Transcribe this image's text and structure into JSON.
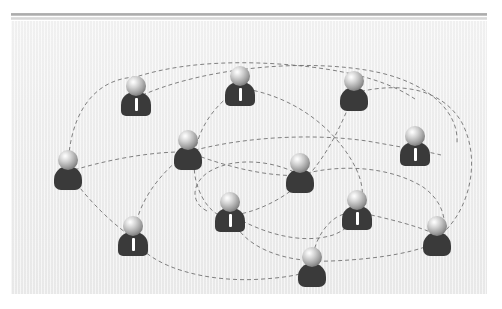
{
  "scene": {
    "title": "Social Network Diagram",
    "description": "Twelve person avatars connected by dashed curved links",
    "panel": {
      "x": 11,
      "y": 21,
      "width": 476,
      "height": 273
    },
    "background_color": "#efefef",
    "page_background": "#ffffff"
  },
  "topbar": {
    "outer_color": "#a9a9a9",
    "inner_color": "#d6d6d6"
  },
  "style": {
    "edge_color": "#6b6b6b",
    "edge_dash": "4 3",
    "edge_width": 1,
    "head_color": "#9a9a9a",
    "body_color": "#3a3a3a",
    "tie_color": "#ffffff"
  },
  "chart_data": {
    "type": "scatter",
    "xlabel": "",
    "ylabel": "",
    "xlim": [
      0,
      476
    ],
    "ylim": [
      0,
      273
    ],
    "grid": false,
    "legend": "none",
    "nodes": [
      {
        "id": "n1",
        "label": "person-1",
        "x": 125,
        "y": 77,
        "variant": "suit",
        "has_tie": true
      },
      {
        "id": "n2",
        "label": "person-2",
        "x": 229,
        "y": 67,
        "variant": "suit",
        "has_tie": true
      },
      {
        "id": "n3",
        "label": "person-3",
        "x": 343,
        "y": 72,
        "variant": "plain",
        "has_tie": false
      },
      {
        "id": "n4",
        "label": "person-4",
        "x": 404,
        "y": 127,
        "variant": "suit",
        "has_tie": true
      },
      {
        "id": "n5",
        "label": "person-5",
        "x": 57,
        "y": 151,
        "variant": "plain",
        "has_tie": false
      },
      {
        "id": "n6",
        "label": "person-6",
        "x": 177,
        "y": 131,
        "variant": "plain",
        "has_tie": false
      },
      {
        "id": "n7",
        "label": "person-7",
        "x": 289,
        "y": 154,
        "variant": "plain",
        "has_tie": false
      },
      {
        "id": "n8",
        "label": "person-8",
        "x": 122,
        "y": 217,
        "variant": "suit",
        "has_tie": true
      },
      {
        "id": "n9",
        "label": "person-9",
        "x": 219,
        "y": 193,
        "variant": "suit",
        "has_tie": true
      },
      {
        "id": "n10",
        "label": "person-10",
        "x": 346,
        "y": 191,
        "variant": "suit",
        "has_tie": true
      },
      {
        "id": "n11",
        "label": "person-11",
        "x": 426,
        "y": 217,
        "variant": "plain",
        "has_tie": false
      },
      {
        "id": "n12",
        "label": "person-12",
        "x": 301,
        "y": 248,
        "variant": "plain",
        "has_tie": false
      }
    ],
    "edges": [
      {
        "source": "n5",
        "target": "n1",
        "path": "M 57 151 C 57 100 78 58 125 56 C 180 38 250 40 300 46 C 348 52 380 62 404 78"
      },
      {
        "source": "n1",
        "target": "n4",
        "path": "M 125 77 C 190 46 300 36 370 52 C 420 64 448 92 446 122"
      },
      {
        "source": "n2",
        "target": "n9",
        "path": "M 229 67 C 190 92 178 130 185 160 C 192 186 206 196 219 198"
      },
      {
        "source": "n2",
        "target": "n10",
        "path": "M 229 67 C 280 74 320 104 341 140 C 356 166 352 182 346 191"
      },
      {
        "source": "n3",
        "target": "n9",
        "path": "M 343 72 C 330 106 316 134 296 156 C 272 180 242 192 222 194"
      },
      {
        "source": "n3",
        "target": "n11",
        "path": "M 343 72 C 390 60 430 68 450 100 C 470 136 460 184 434 210"
      },
      {
        "source": "n6",
        "target": "n4",
        "path": "M 177 131 C 230 116 300 112 356 120 C 390 126 414 130 430 134"
      },
      {
        "source": "n5",
        "target": "n6",
        "path": "M 57 151 C 90 140 140 130 177 131"
      },
      {
        "source": "n6",
        "target": "n7",
        "path": "M 177 131 C 205 142 240 152 270 154 C 280 155 286 154 289 154"
      },
      {
        "source": "n7",
        "target": "n11",
        "path": "M 289 154 C 330 142 380 146 412 166 C 432 180 436 200 432 214"
      },
      {
        "source": "n5",
        "target": "n8",
        "path": "M 57 151 C 70 170 90 192 110 208 C 118 214 120 216 122 217"
      },
      {
        "source": "n6",
        "target": "n8",
        "path": "M 177 131 C 146 154 128 182 124 208 C 123 214 122 216 122 217"
      },
      {
        "source": "n8",
        "target": "n12",
        "path": "M 122 217 C 140 248 200 262 252 258 C 282 256 296 252 301 248"
      },
      {
        "source": "n9",
        "target": "n10",
        "path": "M 219 193 C 250 212 290 224 322 214 C 338 208 344 198 346 191"
      },
      {
        "source": "n10",
        "target": "n11",
        "path": "M 346 191 C 380 198 410 206 426 214"
      },
      {
        "source": "n9",
        "target": "n11",
        "path": "M 219 193 C 230 226 272 242 320 240 C 372 238 410 230 428 220"
      },
      {
        "source": "n12",
        "target": "n10",
        "path": "M 301 248 C 300 228 310 206 326 196 C 338 190 344 190 346 191"
      },
      {
        "source": "n7",
        "target": "n9",
        "path": "M 289 154 C 260 138 220 136 196 152 C 180 164 180 182 196 190"
      }
    ]
  }
}
